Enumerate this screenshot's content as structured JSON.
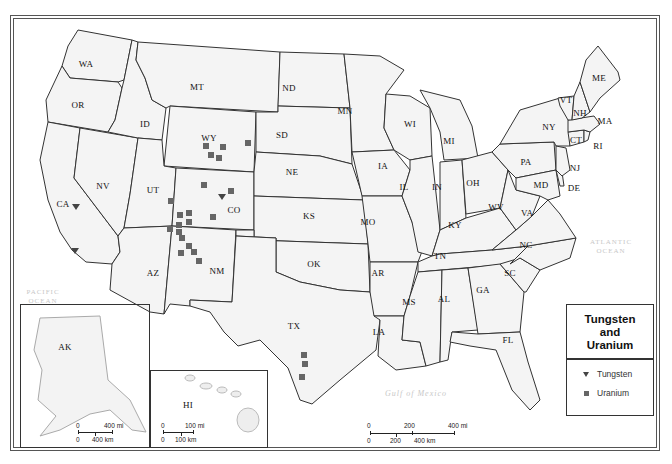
{
  "map": {
    "title": "Tungsten and Uranium",
    "title_lines": [
      "Tungsten",
      "and",
      "Uranium"
    ],
    "legend": {
      "items": [
        {
          "symbol": "triangle-down",
          "label": "Tungsten",
          "color": "#444444"
        },
        {
          "symbol": "square",
          "label": "Uranium",
          "color": "#666666"
        }
      ]
    },
    "states": [
      "WA",
      "OR",
      "CA",
      "NV",
      "ID",
      "MT",
      "WY",
      "UT",
      "CO",
      "AZ",
      "NM",
      "ND",
      "SD",
      "NE",
      "KS",
      "OK",
      "TX",
      "MN",
      "IA",
      "MO",
      "AR",
      "LA",
      "WI",
      "IL",
      "MI",
      "IN",
      "OH",
      "KY",
      "TN",
      "MS",
      "AL",
      "GA",
      "FL",
      "SC",
      "NC",
      "VA",
      "WV",
      "PA",
      "NY",
      "MD",
      "DE",
      "NJ",
      "CT",
      "RI",
      "MA",
      "VT",
      "NH",
      "ME"
    ],
    "state_labels": {
      "WA": "WA",
      "OR": "OR",
      "CA": "CA",
      "NV": "NV",
      "ID": "ID",
      "MT": "MT",
      "WY": "WY",
      "UT": "UT",
      "CO": "CO",
      "AZ": "AZ",
      "NM": "NM",
      "ND": "ND",
      "SD": "SD",
      "NE": "NE",
      "KS": "KS",
      "OK": "OK",
      "TX": "TX",
      "MN": "MN",
      "IA": "IA",
      "MO": "MO",
      "AR": "AR",
      "LA": "LA",
      "WI": "WI",
      "IL": "IL",
      "MI": "MI",
      "IN": "IN",
      "OH": "OH",
      "KY": "KY",
      "TN": "TN",
      "MS": "MS",
      "AL": "AL",
      "GA": "GA",
      "FL": "FL",
      "SC": "SC",
      "NC": "NC",
      "VA": "VA",
      "WV": "WV",
      "PA": "PA",
      "NY": "NY",
      "MD": "MD",
      "DE": "DE",
      "NJ": "NJ",
      "CT": "CT",
      "RI": "RI",
      "MA": "MA",
      "VT": "VT",
      "NH": "NH",
      "ME": "ME",
      "AK": "AK",
      "HI": "HI"
    },
    "water_labels": {
      "pacific": [
        "PACIFIC",
        "OCEAN"
      ],
      "atlantic": [
        "ATLANTIC",
        "OCEAN"
      ],
      "gulf": "Gulf of Mexico"
    },
    "tungsten_sites": [
      {
        "state": "CA",
        "x": 76,
        "y": 207
      },
      {
        "state": "CA",
        "x": 75,
        "y": 251
      },
      {
        "state": "CO",
        "x": 222,
        "y": 197
      }
    ],
    "uranium_sites": [
      {
        "state": "WY",
        "x": 206,
        "y": 146
      },
      {
        "state": "WY",
        "x": 211,
        "y": 155
      },
      {
        "state": "WY",
        "x": 219,
        "y": 158
      },
      {
        "state": "WY",
        "x": 223,
        "y": 147
      },
      {
        "state": "SD",
        "x": 248,
        "y": 143
      },
      {
        "state": "UT",
        "x": 171,
        "y": 201
      },
      {
        "state": "UT",
        "x": 180,
        "y": 215
      },
      {
        "state": "UT",
        "x": 189,
        "y": 213
      },
      {
        "state": "UT",
        "x": 179,
        "y": 225
      },
      {
        "state": "UT",
        "x": 189,
        "y": 222
      },
      {
        "state": "UT",
        "x": 170,
        "y": 229
      },
      {
        "state": "UT",
        "x": 179,
        "y": 232
      },
      {
        "state": "CO",
        "x": 204,
        "y": 185
      },
      {
        "state": "CO",
        "x": 231,
        "y": 191
      },
      {
        "state": "CO",
        "x": 213,
        "y": 217
      },
      {
        "state": "NM",
        "x": 182,
        "y": 238
      },
      {
        "state": "NM",
        "x": 189,
        "y": 246
      },
      {
        "state": "NM",
        "x": 181,
        "y": 253
      },
      {
        "state": "NM",
        "x": 194,
        "y": 252
      },
      {
        "state": "NM",
        "x": 199,
        "y": 261
      },
      {
        "state": "TX",
        "x": 304,
        "y": 355
      },
      {
        "state": "TX",
        "x": 305,
        "y": 364
      },
      {
        "state": "TX",
        "x": 302,
        "y": 377
      }
    ],
    "scales": {
      "main": {
        "mi_labels": [
          "0",
          "200",
          "400 mi"
        ],
        "km_labels": [
          "0",
          "200",
          "400 km"
        ]
      },
      "alaska": {
        "mi_labels": [
          "0",
          "400 mi"
        ],
        "km_labels": [
          "0",
          "400 km"
        ]
      },
      "hawaii": {
        "mi_labels": [
          "0",
          "100 mi"
        ],
        "km_labels": [
          "0",
          "100 km"
        ]
      }
    }
  }
}
